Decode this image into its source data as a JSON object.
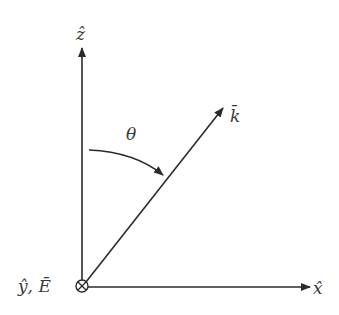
{
  "diagram": {
    "type": "coordinate-vectors",
    "labels": {
      "z_axis": "ẑ",
      "x_axis": "x̂",
      "origin": "ŷ, Ē",
      "k_vector": "k̄",
      "angle": "θ"
    },
    "elements": [
      {
        "name": "z-axis",
        "from": [
          82,
          286
        ],
        "to": [
          82,
          47
        ]
      },
      {
        "name": "x-axis",
        "from": [
          88,
          287
        ],
        "to": [
          310,
          287
        ]
      },
      {
        "name": "k-vector",
        "from": [
          86,
          282
        ],
        "to": [
          223,
          108
        ]
      },
      {
        "name": "theta-arc",
        "from": [
          89,
          150
        ],
        "to": [
          165,
          177
        ]
      },
      {
        "name": "into-page-symbol",
        "center": [
          82,
          286
        ],
        "radius": 6
      }
    ],
    "colors": {
      "stroke": "#2b2b2b",
      "text": "#3a3a3a"
    }
  }
}
